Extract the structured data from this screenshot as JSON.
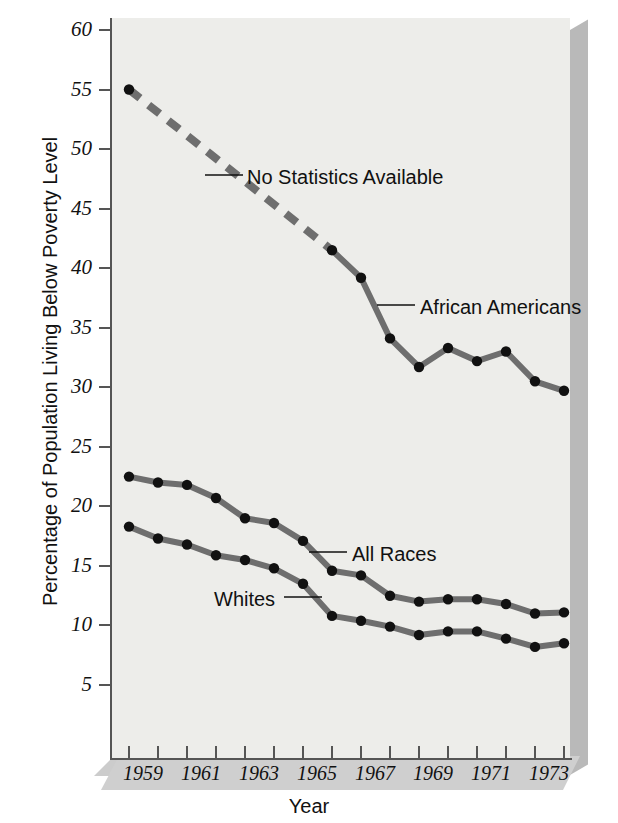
{
  "figure": {
    "background_color": "#ffffff",
    "plot_color": "#ededea",
    "line_color": "#6e6e6e",
    "marker_color": "#111111"
  },
  "axes": {
    "x_title": "Year",
    "y_title": "Percentage of Population Living Below Poverty Level",
    "x_ticks": [
      "1959",
      "",
      "1961",
      "",
      "1963",
      "",
      "1965",
      "",
      "1967",
      "",
      "1969",
      "",
      "1971",
      "",
      "1973",
      ""
    ],
    "x_tick_labels_shown": [
      "1959",
      "1961",
      "1963",
      "1965",
      "1967",
      "1969",
      "1971",
      "1973"
    ],
    "y_ticks": [
      "60",
      "55",
      "50",
      "45",
      "40",
      "35",
      "30",
      "25",
      "20",
      "15",
      "10",
      "5"
    ]
  },
  "annotations": [
    {
      "name": "no-statistics-available",
      "text": "No Statistics Available"
    },
    {
      "name": "african-americans",
      "text": "African Americans"
    },
    {
      "name": "all-races",
      "text": "All Races"
    },
    {
      "name": "whites",
      "text": "Whites"
    }
  ],
  "chart_data": {
    "type": "line",
    "title": "",
    "xlabel": "Year",
    "ylabel": "Percentage of Population Living Below Poverty Level",
    "xlim": [
      1959,
      1974
    ],
    "ylim": [
      0,
      60
    ],
    "grid": false,
    "legend": "inline-annotations",
    "x": [
      1959,
      1960,
      1961,
      1962,
      1963,
      1964,
      1965,
      1966,
      1967,
      1968,
      1969,
      1970,
      1971,
      1972,
      1973,
      1974
    ],
    "series": [
      {
        "name": "African Americans",
        "style": "dashed-then-solid",
        "dashed_segment_years": [
          1959,
          1966
        ],
        "values": [
          55.0,
          null,
          null,
          null,
          null,
          null,
          null,
          41.5,
          39.2,
          34.1,
          31.7,
          33.3,
          32.2,
          33.0,
          30.5,
          29.7
        ],
        "known_points": [
          {
            "year": 1959,
            "value": 55.0
          },
          {
            "year": 1966,
            "value": 41.5
          },
          {
            "year": 1967,
            "value": 39.2
          },
          {
            "year": 1968,
            "value": 34.1
          },
          {
            "year": 1969,
            "value": 31.7
          },
          {
            "year": 1970,
            "value": 33.3
          },
          {
            "year": 1971,
            "value": 32.2
          },
          {
            "year": 1972,
            "value": 33.0
          },
          {
            "year": 1973,
            "value": 30.5
          },
          {
            "year": 1974,
            "value": 29.7
          }
        ]
      },
      {
        "name": "All Races",
        "style": "solid",
        "values": [
          22.5,
          22.0,
          21.8,
          20.7,
          19.0,
          18.6,
          17.1,
          14.6,
          14.2,
          12.5,
          12.0,
          12.2,
          12.2,
          11.8,
          11.0,
          11.1
        ]
      },
      {
        "name": "Whites",
        "style": "solid",
        "values": [
          18.3,
          17.3,
          16.8,
          15.9,
          15.5,
          14.8,
          13.5,
          10.8,
          10.4,
          9.9,
          9.2,
          9.5,
          9.5,
          8.9,
          8.2,
          8.5
        ]
      }
    ]
  }
}
